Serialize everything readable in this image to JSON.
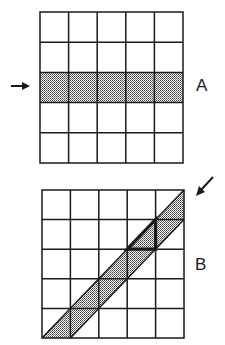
{
  "panels": [
    {
      "id": "A",
      "label": "A",
      "grid": {
        "rows": 5,
        "cols": 5,
        "x": 40,
        "y": 12,
        "width": 143,
        "height": 151
      },
      "highlight": "row 3 (middle horizontal row) shaded",
      "arrow": {
        "direction": "right",
        "position": "left of grid, pointing at shaded row"
      }
    },
    {
      "id": "B",
      "label": "B",
      "grid": {
        "rows": 5,
        "cols": 5,
        "x": 42,
        "y": 190,
        "width": 142,
        "height": 148
      },
      "highlight": "diagonal band from bottom-left to top-right shaded, one triangle outlined in bold",
      "arrow": {
        "direction": "down-left",
        "position": "upper right corner, pointing at diagonal band"
      }
    }
  ],
  "colors": {
    "line": "#1a1a1a",
    "shade": "#b8b8b8",
    "background": "#ffffff"
  }
}
